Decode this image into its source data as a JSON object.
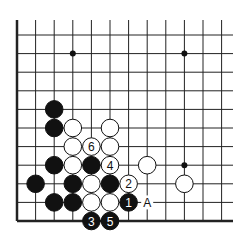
{
  "board": {
    "origin_x": 17,
    "origin_y": 35,
    "spacing": 18.6,
    "cols": 12,
    "rows": 11,
    "line_top": 20,
    "line_right": 233,
    "edges": [
      "left",
      "bottom"
    ],
    "line_color": "#222222",
    "star_points": [
      [
        3,
        1
      ],
      [
        9,
        1
      ],
      [
        9,
        7
      ]
    ]
  },
  "stones": [
    {
      "color": "black",
      "col": 2,
      "row": 4
    },
    {
      "color": "black",
      "col": 2,
      "row": 5
    },
    {
      "color": "white",
      "col": 3,
      "row": 5
    },
    {
      "color": "white",
      "col": 5,
      "row": 5
    },
    {
      "color": "white",
      "col": 3,
      "row": 6
    },
    {
      "color": "white",
      "col": 4,
      "row": 6,
      "label": "6"
    },
    {
      "color": "white",
      "col": 5,
      "row": 6
    },
    {
      "color": "black",
      "col": 2,
      "row": 7
    },
    {
      "color": "white",
      "col": 3,
      "row": 7
    },
    {
      "color": "black",
      "col": 4,
      "row": 7
    },
    {
      "color": "white",
      "col": 5,
      "row": 7,
      "label": "4"
    },
    {
      "color": "white",
      "col": 7,
      "row": 7
    },
    {
      "color": "black",
      "col": 1,
      "row": 8
    },
    {
      "color": "black",
      "col": 3,
      "row": 8
    },
    {
      "color": "white",
      "col": 4,
      "row": 8
    },
    {
      "color": "black",
      "col": 5,
      "row": 8
    },
    {
      "color": "white",
      "col": 6,
      "row": 8,
      "label": "2"
    },
    {
      "color": "white",
      "col": 9,
      "row": 8
    },
    {
      "color": "black",
      "col": 2,
      "row": 9
    },
    {
      "color": "black",
      "col": 3,
      "row": 9
    },
    {
      "color": "white",
      "col": 4,
      "row": 9
    },
    {
      "color": "white",
      "col": 5,
      "row": 9
    },
    {
      "color": "black",
      "col": 6,
      "row": 9,
      "label": "1"
    },
    {
      "color": "black",
      "col": 4,
      "row": 10,
      "label": "3"
    },
    {
      "color": "black",
      "col": 5,
      "row": 10,
      "label": "5"
    }
  ],
  "markers": [
    {
      "col": 7,
      "row": 9,
      "label": "A"
    }
  ]
}
